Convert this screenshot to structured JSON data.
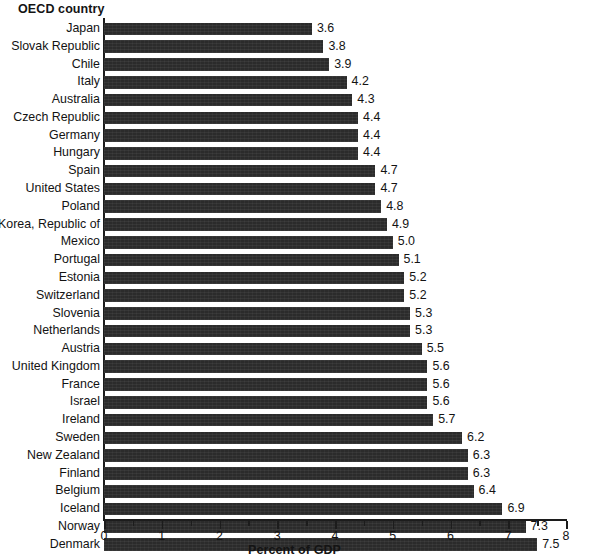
{
  "header": {
    "category_column_title": "OECD country"
  },
  "axis": {
    "x_title": "Percent of GDP",
    "x_min": 0,
    "x_max": 8,
    "x_major_step": 1,
    "x_minor_step": 0.5,
    "x_tick_labels": [
      "0",
      "1",
      "2",
      "3",
      "4",
      "5",
      "6",
      "7",
      "8"
    ]
  },
  "style": {
    "bar_color": "#2b2b2b",
    "text_color": "#131313",
    "axis_color": "#1c1c1c",
    "background": "#ffffff"
  },
  "chart_data": {
    "type": "bar",
    "orientation": "horizontal",
    "title": "",
    "subtitle": "",
    "xlabel": "Percent of GDP",
    "ylabel": "OECD country",
    "xlim": [
      0,
      8
    ],
    "grid": false,
    "legend": null,
    "value_labels": true,
    "value_label_format": "0.0",
    "sorted": "ascending-by-value",
    "categories": [
      "Japan",
      "Slovak Republic",
      "Chile",
      "Italy",
      "Australia",
      "Czech Republic",
      "Germany",
      "Hungary",
      "Spain",
      "United States",
      "Poland",
      "Korea, Republic of",
      "Mexico",
      "Portugal",
      "Estonia",
      "Switzerland",
      "Slovenia",
      "Netherlands",
      "Austria",
      "United Kingdom",
      "France",
      "Israel",
      "Ireland",
      "Sweden",
      "New Zealand",
      "Finland",
      "Belgium",
      "Iceland",
      "Norway",
      "Denmark"
    ],
    "values": [
      3.6,
      3.8,
      3.9,
      4.2,
      4.3,
      4.4,
      4.4,
      4.4,
      4.7,
      4.7,
      4.8,
      4.9,
      5.0,
      5.1,
      5.2,
      5.2,
      5.3,
      5.3,
      5.5,
      5.6,
      5.6,
      5.6,
      5.7,
      6.2,
      6.3,
      6.3,
      6.4,
      6.9,
      7.3,
      7.5
    ],
    "labels": [
      "3.6",
      "3.8",
      "3.9",
      "4.2",
      "4.3",
      "4.4",
      "4.4",
      "4.4",
      "4.7",
      "4.7",
      "4.8",
      "4.9",
      "5.0",
      "5.1",
      "5.2",
      "5.2",
      "5.3",
      "5.3",
      "5.5",
      "5.6",
      "5.6",
      "5.6",
      "5.7",
      "6.2",
      "6.3",
      "6.3",
      "6.4",
      "6.9",
      "7.3",
      "7.5"
    ]
  }
}
